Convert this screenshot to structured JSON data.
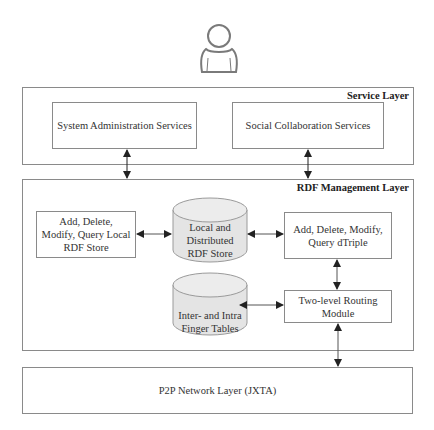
{
  "user": {
    "icon": "user-icon"
  },
  "service_layer": {
    "title": "Service Layer",
    "components": [
      {
        "label": "System Administration Services"
      },
      {
        "label": "Social Collaboration Services"
      }
    ]
  },
  "rdf_layer": {
    "title": "RDF Management Layer",
    "local_ops": {
      "label": "Add, Delete,\nModify, Query Local\nRDF Store"
    },
    "store": {
      "label": "Local and\nDistributed\nRDF Store"
    },
    "dtriple_ops": {
      "label": "Add, Delete, Modify,\nQuery dTriple"
    },
    "finger_tables": {
      "label": "Inter- and Intra\nFinger Tables"
    },
    "routing": {
      "label": "Two-level Routing\nModule"
    }
  },
  "p2p_layer": {
    "title": "P2P Network Layer (JXTA)"
  },
  "colors": {
    "border": "#8a8a8a",
    "cylinder_fill": "#e4e4e4",
    "arrow": "#222222"
  }
}
